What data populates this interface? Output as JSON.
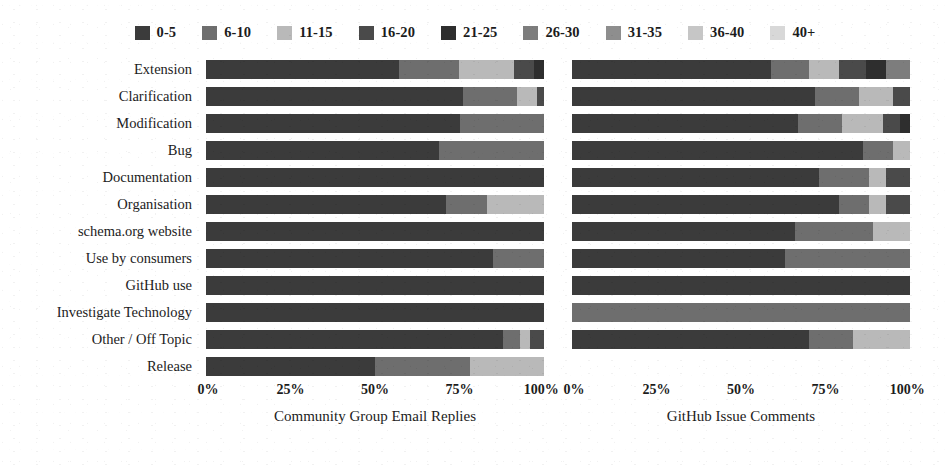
{
  "chart_data": {
    "type": "bar",
    "orientation": "horizontal",
    "stacked": true,
    "normalized": true,
    "title": "",
    "xlabel": "",
    "ylabel": "",
    "xlim": [
      0,
      100
    ],
    "grid": false,
    "legend_position": "top-center",
    "legend_title": "",
    "categories": [
      "Extension",
      "Clarification",
      "Modification",
      "Bug",
      "Documentation",
      "Organisation",
      "schema.org website",
      "Use by consumers",
      "GitHub use",
      "Investigate Technology",
      "Other / Off Topic",
      "Release"
    ],
    "series_names": [
      "0-5",
      "6-10",
      "11-15",
      "16-20",
      "21-25",
      "26-30",
      "31-35",
      "36-40",
      "40+"
    ],
    "series_colors": [
      "#3b3b3b",
      "#6e6e6e",
      "#b9b9b9",
      "#4a4a4a",
      "#2e2e2e",
      "#7d7d7d",
      "#8e8e8e",
      "#c6c6c6",
      "#d8d8d8"
    ],
    "tick_labels": [
      "0%",
      "25%",
      "50%",
      "75%",
      "100%"
    ],
    "tick_values": [
      0,
      25,
      50,
      75,
      100
    ],
    "panels": [
      {
        "name": "left",
        "title": "Community Group Email Replies",
        "values": [
          [
            57,
            18,
            16,
            6,
            3,
            0,
            0,
            0,
            0
          ],
          [
            76,
            16,
            6,
            2,
            0,
            0,
            0,
            0,
            0
          ],
          [
            75,
            25,
            0,
            0,
            0,
            0,
            0,
            0,
            0
          ],
          [
            69,
            31,
            0,
            0,
            0,
            0,
            0,
            0,
            0
          ],
          [
            100,
            0,
            0,
            0,
            0,
            0,
            0,
            0,
            0
          ],
          [
            71,
            12,
            17,
            0,
            0,
            0,
            0,
            0,
            0
          ],
          [
            100,
            0,
            0,
            0,
            0,
            0,
            0,
            0,
            0
          ],
          [
            85,
            15,
            0,
            0,
            0,
            0,
            0,
            0,
            0
          ],
          [
            100,
            0,
            0,
            0,
            0,
            0,
            0,
            0,
            0
          ],
          [
            100,
            0,
            0,
            0,
            0,
            0,
            0,
            0,
            0
          ],
          [
            88,
            5,
            3,
            4,
            0,
            0,
            0,
            0,
            0
          ],
          [
            50,
            28,
            22,
            0,
            0,
            0,
            0,
            0,
            0
          ]
        ]
      },
      {
        "name": "right",
        "title": "GitHub Issue Comments",
        "values": [
          [
            59,
            11,
            9,
            8,
            6,
            7,
            0,
            0,
            0
          ],
          [
            72,
            13,
            10,
            5,
            0,
            0,
            0,
            0,
            0
          ],
          [
            67,
            13,
            12,
            5,
            3,
            0,
            0,
            0,
            0
          ],
          [
            86,
            9,
            5,
            0,
            0,
            0,
            0,
            0,
            0
          ],
          [
            73,
            15,
            5,
            7,
            0,
            0,
            0,
            0,
            0
          ],
          [
            79,
            9,
            5,
            7,
            0,
            0,
            0,
            0,
            0
          ],
          [
            66,
            23,
            11,
            0,
            0,
            0,
            0,
            0,
            0
          ],
          [
            63,
            37,
            0,
            0,
            0,
            0,
            0,
            0,
            0
          ],
          [
            100,
            0,
            0,
            0,
            0,
            0,
            0,
            0,
            0
          ],
          [
            0,
            100,
            0,
            0,
            0,
            0,
            0,
            0,
            0
          ],
          [
            70,
            13,
            17,
            0,
            0,
            0,
            0,
            0,
            0
          ],
          [
            0,
            0,
            0,
            0,
            0,
            0,
            0,
            0,
            0
          ]
        ]
      }
    ]
  },
  "legend": {
    "items": [
      {
        "label": "0-5",
        "color": "#3b3b3b"
      },
      {
        "label": "6-10",
        "color": "#6e6e6e"
      },
      {
        "label": "11-15",
        "color": "#b9b9b9"
      },
      {
        "label": "16-20",
        "color": "#4a4a4a"
      },
      {
        "label": "21-25",
        "color": "#2e2e2e"
      },
      {
        "label": "26-30",
        "color": "#7d7d7d"
      },
      {
        "label": "31-35",
        "color": "#8e8e8e"
      },
      {
        "label": "36-40",
        "color": "#c6c6c6"
      },
      {
        "label": "40+",
        "color": "#d8d8d8"
      }
    ]
  }
}
